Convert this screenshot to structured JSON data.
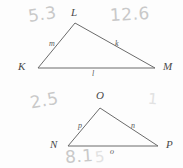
{
  "figure": {
    "ink_color": "#6b6b6b",
    "pencil_color": "#c9c9c9",
    "triangles": [
      {
        "name": "triangle-KLM",
        "vertices": [
          {
            "label": "L",
            "x": 75,
            "y": 23
          },
          {
            "label": "K",
            "x": 38,
            "y": 68
          },
          {
            "label": "M",
            "x": 155,
            "y": 68
          }
        ],
        "side_labels": [
          {
            "label": "m",
            "x": 49,
            "y": 43
          },
          {
            "label": "k",
            "x": 115,
            "y": 43
          },
          {
            "label": "l",
            "x": 92,
            "y": 73
          }
        ],
        "vertex_label_positions": [
          {
            "label": "L",
            "x": 71,
            "y": 7
          },
          {
            "label": "K",
            "x": 18,
            "y": 62
          },
          {
            "label": "M",
            "x": 163,
            "y": 62
          }
        ]
      },
      {
        "name": "triangle-NOP",
        "vertices": [
          {
            "label": "O",
            "x": 100,
            "y": 108
          },
          {
            "label": "N",
            "x": 68,
            "y": 146
          },
          {
            "label": "P",
            "x": 158,
            "y": 146
          }
        ],
        "side_labels": [
          {
            "label": "p",
            "x": 78,
            "y": 125
          },
          {
            "label": "n",
            "x": 131,
            "y": 125
          },
          {
            "label": "o",
            "x": 110,
            "y": 151
          }
        ],
        "vertex_label_positions": [
          {
            "label": "O",
            "x": 96,
            "y": 92
          },
          {
            "label": "N",
            "x": 50,
            "y": 140
          },
          {
            "label": "P",
            "x": 166,
            "y": 140
          }
        ]
      }
    ],
    "annotations": [
      {
        "name": "annotation-5-3",
        "text": "5.3",
        "x": 28,
        "y": 6,
        "rotate": -8,
        "size": "normal"
      },
      {
        "name": "annotation-12-6",
        "text": "12.6",
        "x": 110,
        "y": 6,
        "rotate": -3,
        "size": "normal"
      },
      {
        "name": "annotation-2-5",
        "text": "2.5",
        "x": 30,
        "y": 92,
        "rotate": -10,
        "size": "normal"
      },
      {
        "name": "annotation-8-1",
        "text": "8.1",
        "x": 65,
        "y": 148,
        "rotate": -4,
        "size": "normal"
      },
      {
        "name": "annotation-smudge-right",
        "text": "1",
        "x": 148,
        "y": 92,
        "rotate": 6,
        "size": "faint"
      },
      {
        "name": "annotation-smudge-bottom",
        "text": "5",
        "x": 95,
        "y": 150,
        "rotate": -6,
        "size": "faint"
      }
    ]
  }
}
